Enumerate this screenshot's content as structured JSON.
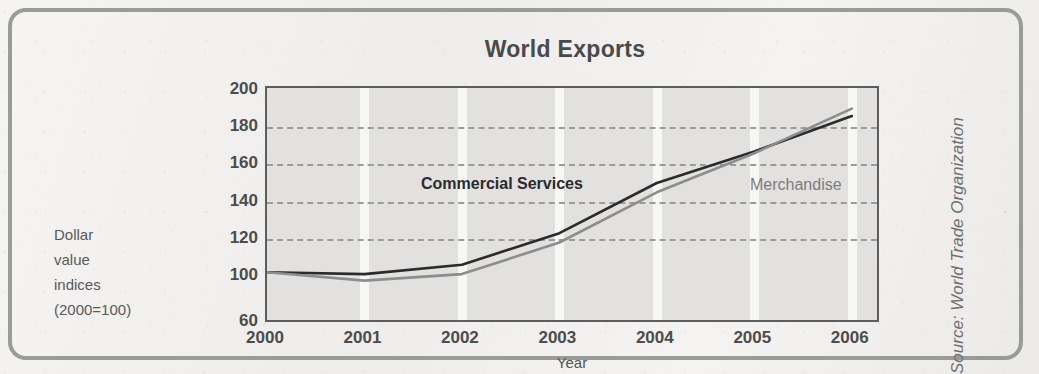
{
  "figure": {
    "title": "World Exports",
    "source": "Source: World Trade Organization",
    "y_caption_lines": [
      "Dollar",
      "value",
      "indices",
      "(2000=100)"
    ],
    "frame_color": "#9a9a99",
    "plot_bg": "#e2e1df"
  },
  "chart_data": {
    "type": "line",
    "title": "World Exports",
    "xlabel": "Year",
    "ylabel": "Dollar value indices (2000=100)",
    "x": [
      2000,
      2001,
      2002,
      2003,
      2004,
      2005,
      2006
    ],
    "xtick_labels": [
      "2000",
      "2001",
      "2002",
      "2003",
      "2004",
      "2005",
      "2006"
    ],
    "ytick_labels": [
      "200",
      "180",
      "160",
      "140",
      "120",
      "100",
      "60"
    ],
    "ytick_values": [
      200,
      180,
      160,
      140,
      120,
      100,
      60
    ],
    "ylim": [
      60,
      200
    ],
    "xlim": [
      2000,
      2006.3
    ],
    "grid": "horizontal-dashed",
    "legend": "inline-labels",
    "note": "y-axis is compressed below 100; the 60 tick sits on the bottom axis line",
    "series": [
      {
        "name": "Commercial Services",
        "color": "#2b2b2b",
        "label_color": "#2b2b2b",
        "bold_label": true,
        "values": [
          102,
          101,
          106,
          123,
          150,
          167,
          186
        ]
      },
      {
        "name": "Merchandise",
        "color": "#8d8d8d",
        "label_color": "#7c7c7c",
        "bold_label": false,
        "values": [
          102,
          96,
          101,
          118,
          145,
          166,
          190
        ]
      }
    ],
    "annotations": [
      {
        "text": "Commercial Services",
        "x": 2002.55,
        "y": 148
      },
      {
        "text": "Merchandise",
        "x": 2005.0,
        "y": 147
      }
    ]
  }
}
